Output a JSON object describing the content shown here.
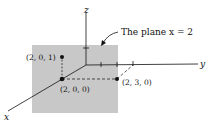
{
  "diagram": {
    "plane_label": "The plane x = 2",
    "axes": {
      "x": "x",
      "y": "y",
      "z": "z"
    },
    "points": [
      {
        "label": "(2, 0, 1)"
      },
      {
        "label": "(2, 0, 0)"
      },
      {
        "label": "(2, 3, 0)"
      }
    ],
    "colors": {
      "plane": "#c8c8c8",
      "ink": "#111111"
    }
  }
}
